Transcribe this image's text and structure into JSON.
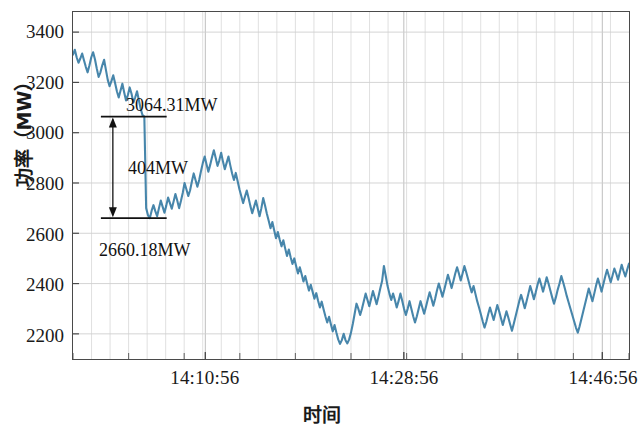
{
  "chart_data": {
    "type": "line",
    "title": "",
    "xlabel": "时间",
    "ylabel": "功率（MW）",
    "grid": true,
    "legend": null,
    "line_color": "#3d7fa6",
    "ylim": [
      2100,
      3480
    ],
    "yticks": [
      2200,
      2400,
      2600,
      2800,
      3000,
      3200,
      3400
    ],
    "ytick_labels": [
      "2200",
      "2400",
      "2600",
      "2800",
      "3000",
      "3200",
      "3400"
    ],
    "xtick_labels": [
      "14:10:56",
      "14:28:56",
      "14:46:56"
    ],
    "xtick_positions": [
      0.238,
      0.595,
      0.952
    ],
    "x_minor_divisions": 30,
    "annotations": [
      {
        "name": "upper-value",
        "text": "3064.31MW",
        "value": 3064.31
      },
      {
        "name": "drop-magnitude",
        "text": "404MW",
        "value": 404
      },
      {
        "name": "lower-value",
        "text": "2660.18MW",
        "value": 2660.18
      }
    ],
    "series": [
      {
        "name": "功率",
        "color": "#3d7fa6",
        "values": [
          3310,
          3330,
          3300,
          3278,
          3295,
          3315,
          3288,
          3262,
          3240,
          3268,
          3300,
          3320,
          3292,
          3255,
          3222,
          3240,
          3268,
          3290,
          3250,
          3210,
          3185,
          3205,
          3228,
          3198,
          3165,
          3140,
          3168,
          3195,
          3160,
          3128,
          3150,
          3180,
          3155,
          3120,
          3140,
          3165,
          3130,
          3095,
          3070,
          3064,
          2700,
          2672,
          2660,
          2690,
          2712,
          2688,
          2668,
          2700,
          2730,
          2706,
          2682,
          2710,
          2742,
          2720,
          2698,
          2726,
          2756,
          2730,
          2700,
          2728,
          2760,
          2800,
          2775,
          2748,
          2770,
          2806,
          2838,
          2812,
          2785,
          2812,
          2848,
          2880,
          2905,
          2875,
          2845,
          2872,
          2902,
          2930,
          2900,
          2868,
          2890,
          2920,
          2885,
          2855,
          2880,
          2905,
          2870,
          2838,
          2812,
          2840,
          2808,
          2775,
          2748,
          2720,
          2745,
          2770,
          2740,
          2708,
          2680,
          2705,
          2730,
          2700,
          2668,
          2700,
          2740,
          2710,
          2678,
          2650,
          2620,
          2645,
          2612,
          2580,
          2605,
          2575,
          2548,
          2572,
          2540,
          2510,
          2535,
          2505,
          2478,
          2500,
          2470,
          2440,
          2465,
          2438,
          2408,
          2430,
          2400,
          2372,
          2395,
          2368,
          2340,
          2362,
          2332,
          2305,
          2328,
          2298,
          2270,
          2245,
          2268,
          2238,
          2210,
          2235,
          2205,
          2178,
          2160,
          2175,
          2200,
          2175,
          2162,
          2178,
          2205,
          2240,
          2280,
          2320,
          2300,
          2275,
          2300,
          2330,
          2360,
          2335,
          2310,
          2340,
          2370,
          2345,
          2318,
          2348,
          2380,
          2410,
          2470,
          2430,
          2390,
          2360,
          2335,
          2360,
          2335,
          2305,
          2330,
          2360,
          2332,
          2300,
          2275,
          2300,
          2330,
          2300,
          2270,
          2245,
          2270,
          2300,
          2330,
          2305,
          2280,
          2308,
          2338,
          2365,
          2340,
          2312,
          2340,
          2372,
          2400,
          2375,
          2348,
          2375,
          2405,
          2435,
          2410,
          2382,
          2410,
          2440,
          2465,
          2440,
          2412,
          2440,
          2470,
          2445,
          2418,
          2390,
          2365,
          2390,
          2360,
          2330,
          2305,
          2278,
          2250,
          2225,
          2248,
          2278,
          2305,
          2280,
          2255,
          2285,
          2315,
          2290,
          2262,
          2235,
          2262,
          2290,
          2265,
          2238,
          2212,
          2240,
          2270,
          2300,
          2330,
          2355,
          2330,
          2302,
          2330,
          2360,
          2390,
          2365,
          2338,
          2365,
          2395,
          2420,
          2395,
          2368,
          2395,
          2425,
          2400,
          2372,
          2345,
          2320,
          2345,
          2375,
          2400,
          2430,
          2405,
          2378,
          2350,
          2325,
          2300,
          2275,
          2250,
          2225,
          2205,
          2230,
          2260,
          2290,
          2320,
          2350,
          2380,
          2355,
          2330,
          2360,
          2392,
          2420,
          2395,
          2368,
          2398,
          2428,
          2455,
          2430,
          2405,
          2432,
          2460,
          2440,
          2415,
          2445,
          2475,
          2450,
          2428,
          2455,
          2480
        ]
      }
    ]
  }
}
